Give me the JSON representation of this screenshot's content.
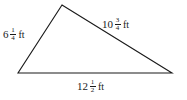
{
  "figure": {
    "type": "triangle-diagram",
    "background_color": "#ffffff",
    "stroke_color": "#1a1a1a",
    "unit": "ft",
    "vertices": {
      "apex": {
        "x": 62,
        "y": 5
      },
      "left": {
        "x": 18,
        "y": 73
      },
      "right": {
        "x": 172,
        "y": 73
      }
    },
    "sides": [
      {
        "id": "left-side",
        "position": "left",
        "whole": "6",
        "numerator": "1",
        "denominator": "4",
        "unit": "ft",
        "full_text": "6 1/4 ft"
      },
      {
        "id": "right-side",
        "position": "upper-right",
        "whole": "10",
        "numerator": "3",
        "denominator": "4",
        "unit": "ft",
        "full_text": "10 3/4 ft"
      },
      {
        "id": "bottom-side",
        "position": "bottom",
        "whole": "12",
        "numerator": "1",
        "denominator": "2",
        "unit": "ft",
        "full_text": "12 1/2 ft"
      }
    ]
  }
}
